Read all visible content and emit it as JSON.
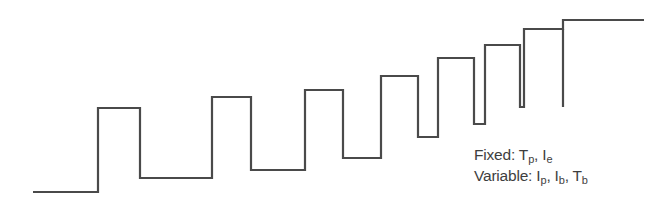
{
  "diagram": {
    "type": "staircase-pulse-waveform",
    "stroke_color": "#4a4a4a",
    "text_color": "#3e3e3e",
    "waveform_points": [
      [
        33,
        192
      ],
      [
        98,
        192
      ],
      [
        98,
        108
      ],
      [
        140,
        108
      ],
      [
        140,
        178
      ],
      [
        212,
        178
      ],
      [
        212,
        97
      ],
      [
        251,
        97
      ],
      [
        251,
        170
      ],
      [
        305,
        170
      ],
      [
        305,
        90
      ],
      [
        343,
        90
      ],
      [
        343,
        158
      ],
      [
        381,
        158
      ],
      [
        381,
        76
      ],
      [
        418,
        76
      ],
      [
        418,
        137
      ],
      [
        438,
        137
      ],
      [
        438,
        58
      ],
      [
        474,
        58
      ],
      [
        474,
        124
      ],
      [
        485,
        124
      ],
      [
        485,
        45
      ],
      [
        520,
        45
      ],
      [
        520,
        107
      ],
      [
        524,
        107
      ],
      [
        524,
        29
      ],
      [
        563,
        29
      ],
      [
        563,
        20
      ],
      [
        644,
        20
      ]
    ],
    "final_stub": [
      [
        563,
        29
      ],
      [
        563,
        107
      ]
    ]
  },
  "legend": {
    "fixed": {
      "label": "Fixed:",
      "params": [
        {
          "symbol": "T",
          "sub": "p",
          "sep": ", "
        },
        {
          "symbol": "I",
          "sub": "e",
          "sep": ""
        }
      ]
    },
    "variable": {
      "label": "Variable:",
      "params": [
        {
          "symbol": "I",
          "sub": "p",
          "sep": ", "
        },
        {
          "symbol": "I",
          "sub": "b",
          "sep": ", "
        },
        {
          "symbol": "T",
          "sub": "b",
          "sep": ""
        }
      ]
    }
  }
}
